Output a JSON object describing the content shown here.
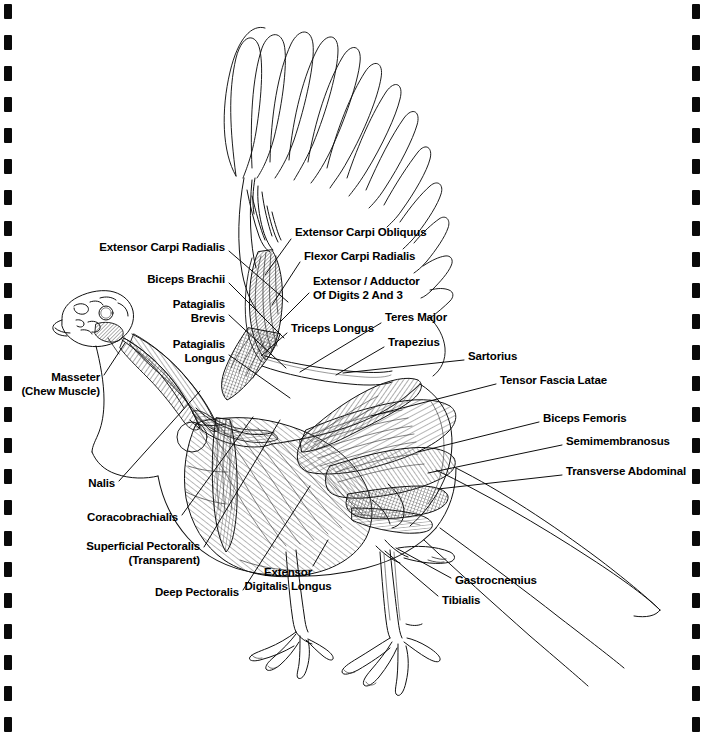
{
  "document": {
    "type": "anatomical-diagram",
    "subject": "Turkey Musculature (Lateral View)",
    "binding": {
      "style": "spiral-notebook",
      "hole_color": "#0a0a0a",
      "hole_count": 24
    }
  },
  "colors": {
    "ink": "#000000",
    "paper": "#ffffff",
    "hatch": "#4a4a4a",
    "shade_light": "#d8d8d8",
    "shade_mid": "#b0b0b0",
    "shade_dark": "#6f6f6f"
  },
  "labels": [
    {
      "id": "extensor-carpi-radialis",
      "text": "Extensor Carpi Radialis",
      "x": 225,
      "y": 248,
      "align": "right"
    },
    {
      "id": "extensor-carpi-obliquus",
      "text": "Extensor Carpi Obliquus",
      "x": 295,
      "y": 233,
      "align": "left"
    },
    {
      "id": "flexor-carpi-radialis",
      "text": "Flexor Carpi Radialis",
      "x": 304,
      "y": 257,
      "align": "left"
    },
    {
      "id": "biceps-brachii",
      "text": "Biceps Brachii",
      "x": 225,
      "y": 280,
      "align": "right"
    },
    {
      "id": "extensor-adductor-digits",
      "text": "Extensor / Adductor\nOf Digits 2 And 3",
      "x": 313,
      "y": 282,
      "align": "left"
    },
    {
      "id": "patagialis-brevis",
      "text": "Patagialis\nBrevis",
      "x": 225,
      "y": 305,
      "align": "right"
    },
    {
      "id": "triceps-longus",
      "text": "Triceps Longus",
      "x": 291,
      "y": 329,
      "align": "left"
    },
    {
      "id": "teres-major",
      "text": "Teres Major",
      "x": 385,
      "y": 318,
      "align": "left"
    },
    {
      "id": "trapezius",
      "text": "Trapezius",
      "x": 388,
      "y": 343,
      "align": "left"
    },
    {
      "id": "patagialis-longus",
      "text": "Patagialis\nLongus",
      "x": 225,
      "y": 345,
      "align": "right"
    },
    {
      "id": "sartorius",
      "text": "Sartorius",
      "x": 468,
      "y": 357,
      "align": "left"
    },
    {
      "id": "tensor-fascia-latae",
      "text": "Tensor Fascia Latae",
      "x": 500,
      "y": 381,
      "align": "left"
    },
    {
      "id": "masseter",
      "text": "Masseter\n(Chew Muscle)",
      "x": 100,
      "y": 378,
      "align": "right"
    },
    {
      "id": "biceps-femoris",
      "text": "Biceps Femoris",
      "x": 543,
      "y": 419,
      "align": "left"
    },
    {
      "id": "semimembranosus",
      "text": "Semimembranosus",
      "x": 566,
      "y": 442,
      "align": "left"
    },
    {
      "id": "transverse-abdominal",
      "text": "Transverse Abdominal",
      "x": 566,
      "y": 472,
      "align": "left"
    },
    {
      "id": "nalis",
      "text": "Nalis",
      "x": 115,
      "y": 484,
      "align": "right"
    },
    {
      "id": "coracobrachialis",
      "text": "Coracobrachialis",
      "x": 178,
      "y": 518,
      "align": "right"
    },
    {
      "id": "superficial-pectoralis",
      "text": "Superficial Pectoralis\n(Transparent)",
      "x": 200,
      "y": 547,
      "align": "right"
    },
    {
      "id": "extensor-digitalis-longus",
      "text": "Extensor\nDigitalis Longus",
      "x": 288,
      "y": 573,
      "align": "center"
    },
    {
      "id": "deep-pectoralis",
      "text": "Deep Pectoralis",
      "x": 239,
      "y": 593,
      "align": "right"
    },
    {
      "id": "gastrocnemius",
      "text": "Gastrocnemius",
      "x": 455,
      "y": 581,
      "align": "left"
    },
    {
      "id": "tibialis",
      "text": "Tibialis",
      "x": 442,
      "y": 601,
      "align": "left"
    }
  ],
  "leader_lines": [
    {
      "id": "ll-extensor-carpi-radialis",
      "x1": 229,
      "y1": 251,
      "x2": 288,
      "y2": 302
    },
    {
      "id": "ll-extensor-carpi-obliquus",
      "x1": 291,
      "y1": 239,
      "x2": 265,
      "y2": 275
    },
    {
      "id": "ll-flexor-carpi-radialis",
      "x1": 300,
      "y1": 262,
      "x2": 272,
      "y2": 305
    },
    {
      "id": "ll-biceps-brachii",
      "x1": 229,
      "y1": 283,
      "x2": 284,
      "y2": 338
    },
    {
      "id": "ll-extensor-adductor",
      "x1": 309,
      "y1": 293,
      "x2": 280,
      "y2": 322
    },
    {
      "id": "ll-patagialis-brevis",
      "x1": 229,
      "y1": 315,
      "x2": 286,
      "y2": 368
    },
    {
      "id": "ll-triceps-longus",
      "x1": 287,
      "y1": 333,
      "x2": 261,
      "y2": 356
    },
    {
      "id": "ll-teres-major",
      "x1": 381,
      "y1": 323,
      "x2": 300,
      "y2": 372
    },
    {
      "id": "ll-trapezius",
      "x1": 384,
      "y1": 347,
      "x2": 336,
      "y2": 375
    },
    {
      "id": "ll-patagialis-longus",
      "x1": 229,
      "y1": 355,
      "x2": 290,
      "y2": 398
    },
    {
      "id": "ll-sartorius",
      "x1": 464,
      "y1": 360,
      "x2": 343,
      "y2": 373
    },
    {
      "id": "ll-tensor-fascia-latae",
      "x1": 496,
      "y1": 384,
      "x2": 371,
      "y2": 416
    },
    {
      "id": "ll-masseter",
      "x1": 104,
      "y1": 375,
      "x2": 125,
      "y2": 343
    },
    {
      "id": "ll-biceps-femoris",
      "x1": 539,
      "y1": 422,
      "x2": 418,
      "y2": 452
    },
    {
      "id": "ll-semimembranosus",
      "x1": 562,
      "y1": 445,
      "x2": 428,
      "y2": 473
    },
    {
      "id": "ll-transverse-abdominal",
      "x1": 562,
      "y1": 475,
      "x2": 438,
      "y2": 489
    },
    {
      "id": "ll-nalis",
      "x1": 119,
      "y1": 481,
      "x2": 200,
      "y2": 391
    },
    {
      "id": "ll-coracobrachialis",
      "x1": 182,
      "y1": 515,
      "x2": 253,
      "y2": 417
    },
    {
      "id": "ll-superficial-pectoralis",
      "x1": 204,
      "y1": 547,
      "x2": 280,
      "y2": 420
    },
    {
      "id": "ll-extensor-digitalis-longus",
      "x1": 313,
      "y1": 566,
      "x2": 328,
      "y2": 540
    },
    {
      "id": "ll-deep-pectoralis",
      "x1": 243,
      "y1": 590,
      "x2": 310,
      "y2": 486
    },
    {
      "id": "ll-gastrocnemius",
      "x1": 451,
      "y1": 578,
      "x2": 396,
      "y2": 548
    },
    {
      "id": "ll-tibialis",
      "x1": 438,
      "y1": 596,
      "x2": 385,
      "y2": 551
    }
  ]
}
